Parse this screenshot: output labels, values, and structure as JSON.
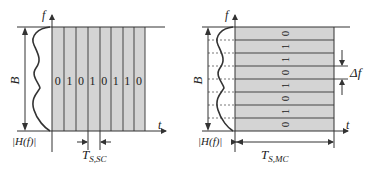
{
  "left_panel": {
    "title": "Single-carrier",
    "f_axis_label": "f",
    "t_axis_label": "t",
    "bandwidth_label": "B",
    "channel_label": "|H(f)|",
    "symbol_period_label_main": "T",
    "symbol_period_label_sub": "S,SC",
    "bits": [
      "0",
      "1",
      "0",
      "1",
      "0",
      "1",
      "1",
      "0"
    ]
  },
  "right_panel": {
    "title": "Multi-carrier",
    "f_axis_label": "f",
    "t_axis_label": "t",
    "bandwidth_label": "B",
    "channel_label": "|H(f)|",
    "symbol_period_label_main": "T",
    "symbol_period_label_sub": "S,MC",
    "subcarrier_spacing_label": "Δf",
    "bits_bottom_to_top": [
      "0",
      "1",
      "0",
      "1",
      "0",
      "1",
      "1",
      "0"
    ]
  },
  "colors": {
    "fill": "#d4d4d4",
    "line": "#333333"
  }
}
